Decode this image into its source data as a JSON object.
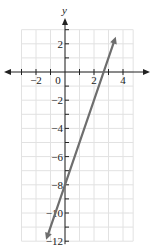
{
  "chart_data": {
    "type": "line",
    "title": "",
    "xlabel": "",
    "ylabel": "y",
    "xlim": [
      -3.5,
      5
    ],
    "ylim": [
      -12,
      3.5
    ],
    "grid": true,
    "x_ticks": [
      -2,
      0,
      2,
      4
    ],
    "y_ticks": [
      2,
      -2,
      -4,
      -6,
      -8,
      -10,
      -12
    ],
    "x_tick_labels": [
      "−2",
      "0",
      "2",
      "4"
    ],
    "y_tick_labels": [
      "2",
      "−2",
      "−4",
      "−6",
      "−8",
      "−10",
      "−12"
    ],
    "series": [
      {
        "name": "y = 3x − 8",
        "equation": "y = 3x - 8",
        "slope": 3,
        "y_intercept": -8,
        "x_intercept": 2.67,
        "points": [
          [
            -1.3,
            -11.9
          ],
          [
            3.5,
            2.5
          ]
        ],
        "arrows": "both",
        "color": "#6e6e6e"
      }
    ]
  },
  "axis_label_y": "y",
  "colors": {
    "grid": "#e2e2e2",
    "axis": "#222222",
    "line": "#6e6e6e"
  }
}
